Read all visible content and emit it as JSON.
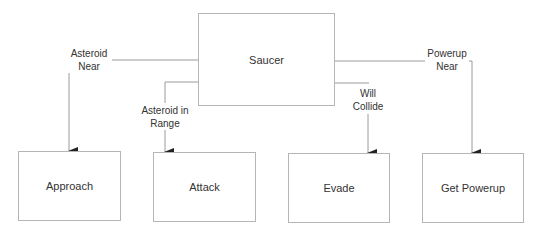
{
  "diagram": {
    "root": {
      "label": "Saucer"
    },
    "states": [
      {
        "id": "approach",
        "label": "Approach"
      },
      {
        "id": "attack",
        "label": "Attack"
      },
      {
        "id": "evade",
        "label": "Evade"
      },
      {
        "id": "get_powerup",
        "label": "Get Powerup"
      }
    ],
    "transitions": [
      {
        "from": "Saucer",
        "to": "Approach",
        "line1": "Asteroid",
        "line2": "Near"
      },
      {
        "from": "Saucer",
        "to": "Attack",
        "line1": "Asteroid in",
        "line2": "Range"
      },
      {
        "from": "Saucer",
        "to": "Evade",
        "line1": "Will",
        "line2": "Collide"
      },
      {
        "from": "Saucer",
        "to": "Get Powerup",
        "line1": "Powerup",
        "line2": "Near"
      }
    ],
    "colors": {
      "line": "#9a9a9a",
      "border": "#b5b5b5",
      "arrow": "#222222",
      "text": "#333333"
    }
  }
}
